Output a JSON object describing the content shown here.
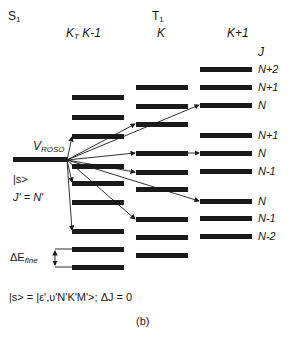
{
  "headers": {
    "s1": "S",
    "s1_sub": "1",
    "t1": "T",
    "t1_sub": "1",
    "col_left_k": "K",
    "col_left_k_sub": "T",
    "col_left": "K-1",
    "col_mid": "K",
    "col_right": "K+1",
    "j_label": "J"
  },
  "state_labels": {
    "v_roso": "V",
    "v_roso_sub": "ROSO",
    "ket": "|s>",
    "j_eq": "J' = N'"
  },
  "delta_e": {
    "prefix": "ΔE",
    "sub": "fine"
  },
  "right_labels": [
    "N+2",
    "N+1",
    "N",
    "N+1",
    "N",
    "N-1",
    "N",
    "N-1",
    "N-2"
  ],
  "footer": {
    "equation": "|s> = |ε',υ'N'K'M'>; ΔJ = 0",
    "caption": "(b)"
  },
  "colors": {
    "ink": "#1a1a1a",
    "background": "#ffffff"
  }
}
